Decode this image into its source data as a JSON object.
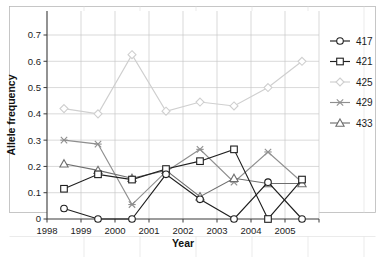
{
  "top_cut_text": "",
  "axes": {
    "ylabel": "Allele frequency",
    "xlabel": "Year",
    "yticks": [
      "0",
      "0.1",
      "0.2",
      "0.3",
      "0.4",
      "0.5",
      "0.6",
      "0.7"
    ],
    "xticks": [
      "1998",
      "1999",
      "2000",
      "2001",
      "2002",
      "2003",
      "2004",
      "2005"
    ]
  },
  "legend": {
    "items": [
      {
        "label": "417",
        "marker": "circle",
        "color": "#1f1f1f"
      },
      {
        "label": "421",
        "marker": "square",
        "color": "#1f1f1f"
      },
      {
        "label": "425",
        "marker": "diamond",
        "color": "#cfcfcf"
      },
      {
        "label": "429",
        "marker": "asterisk",
        "color": "#8f8f8f"
      },
      {
        "label": "433",
        "marker": "triangle",
        "color": "#6e6e6e"
      }
    ]
  },
  "chart_data": {
    "type": "line",
    "title": "",
    "xlabel": "Year",
    "ylabel": "Allele frequency",
    "xlim": [
      1998,
      2006
    ],
    "ylim": [
      0,
      0.7
    ],
    "grid": true,
    "legend_position": "right",
    "x": [
      1998.5,
      1999.5,
      2000.5,
      2001.5,
      2002.5,
      2003.5,
      2004.5,
      2005.5
    ],
    "series": [
      {
        "name": "417",
        "marker": "circle",
        "color": "#1f1f1f",
        "values": [
          0.04,
          0.0,
          0.0,
          0.17,
          0.075,
          0.0,
          0.14,
          0.0
        ]
      },
      {
        "name": "421",
        "marker": "square",
        "color": "#1f1f1f",
        "values": [
          0.115,
          0.17,
          0.15,
          0.19,
          0.22,
          0.265,
          0.0,
          0.15
        ]
      },
      {
        "name": "425",
        "marker": "diamond",
        "color": "#cfcfcf",
        "values": [
          0.42,
          0.4,
          0.625,
          0.41,
          0.445,
          0.43,
          0.5,
          0.6
        ]
      },
      {
        "name": "429",
        "marker": "asterisk",
        "color": "#8f8f8f",
        "values": [
          0.3,
          0.285,
          0.055,
          0.18,
          0.265,
          0.14,
          0.255,
          0.14
        ]
      },
      {
        "name": "433",
        "marker": "triangle",
        "color": "#6e6e6e",
        "values": [
          0.21,
          0.185,
          0.155,
          0.185,
          0.085,
          0.155,
          0.135,
          0.135
        ]
      }
    ]
  }
}
